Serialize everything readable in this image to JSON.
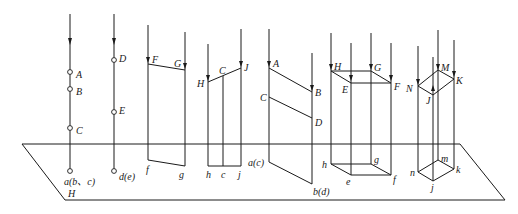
{
  "diagram": {
    "type": "orthographic-projection",
    "plane": {
      "label": "H"
    },
    "groups": [
      {
        "id": "points-abc",
        "space_labels": [
          "A",
          "B",
          "C"
        ],
        "projection_label": "a(b、c)"
      },
      {
        "id": "points-de",
        "space_labels": [
          "D",
          "E"
        ],
        "projection_label": "d(e)"
      },
      {
        "id": "segment-fg",
        "space_labels": [
          "F",
          "G"
        ],
        "projection_labels": [
          "f",
          "g"
        ]
      },
      {
        "id": "segment-hj",
        "space_labels": [
          "H",
          "C",
          "J"
        ],
        "projection_labels": [
          "h",
          "c",
          "j"
        ]
      },
      {
        "id": "segments-ab-cd",
        "space_labels": [
          "A",
          "B",
          "C",
          "D"
        ],
        "projection_labels": [
          "a(c)",
          "b(d)"
        ]
      },
      {
        "id": "rectangle-hgfe",
        "space_labels": [
          "H",
          "G",
          "E",
          "F"
        ],
        "projection_labels": [
          "h",
          "g",
          "e",
          "f"
        ]
      },
      {
        "id": "rhombus-mknj",
        "space_labels": [
          "M",
          "K",
          "N",
          "J"
        ],
        "projection_labels": [
          "m",
          "k",
          "n",
          "j"
        ]
      }
    ]
  }
}
